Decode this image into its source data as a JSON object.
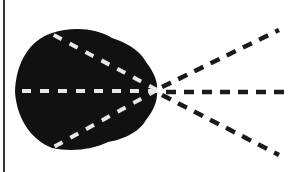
{
  "diagram": {
    "description": "Black lobed shape with converging dashed lines",
    "colors": {
      "background": "#ffffff",
      "shape": "#111111",
      "inner_dash": "#e8e8e8",
      "outer_dash": "#1a1a1a",
      "frame_line": "#333333"
    },
    "convergence_point": {
      "x": 157,
      "y": 90
    },
    "inner_lines": [
      {
        "name": "upper",
        "x1": 157,
        "y1": 90,
        "x2": 50,
        "y2": 33
      },
      {
        "name": "middle",
        "x1": 157,
        "y1": 90,
        "x2": 15,
        "y2": 91
      },
      {
        "name": "lower",
        "x1": 157,
        "y1": 90,
        "x2": 52,
        "y2": 148
      }
    ],
    "outer_lines": [
      {
        "name": "upper",
        "x1": 160,
        "y1": 88,
        "x2": 279,
        "y2": 30
      },
      {
        "name": "middle",
        "x1": 165,
        "y1": 90,
        "x2": 290,
        "y2": 90
      },
      {
        "name": "lower",
        "x1": 160,
        "y1": 93,
        "x2": 279,
        "y2": 155
      }
    ]
  }
}
